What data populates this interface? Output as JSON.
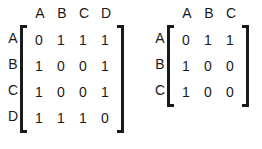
{
  "background_color": "#ffffff",
  "text_color": "#1a1a1a",
  "figure": {
    "type": "adjacency-matrices",
    "count": 2
  },
  "matrices": [
    {
      "name": "adjacency-matrix-4x4",
      "row_labels": [
        "A",
        "B",
        "C",
        "D"
      ],
      "col_labels": [
        "A",
        "B",
        "C",
        "D"
      ],
      "rows": [
        [
          "0",
          "1",
          "1",
          "1"
        ],
        [
          "1",
          "0",
          "0",
          "1"
        ],
        [
          "1",
          "0",
          "0",
          "1"
        ],
        [
          "1",
          "1",
          "1",
          "0"
        ]
      ]
    },
    {
      "name": "adjacency-matrix-3x3",
      "row_labels": [
        "A",
        "B",
        "C"
      ],
      "col_labels": [
        "A",
        "B",
        "C"
      ],
      "rows": [
        [
          "0",
          "1",
          "1"
        ],
        [
          "1",
          "0",
          "0"
        ],
        [
          "1",
          "0",
          "0"
        ]
      ]
    }
  ]
}
